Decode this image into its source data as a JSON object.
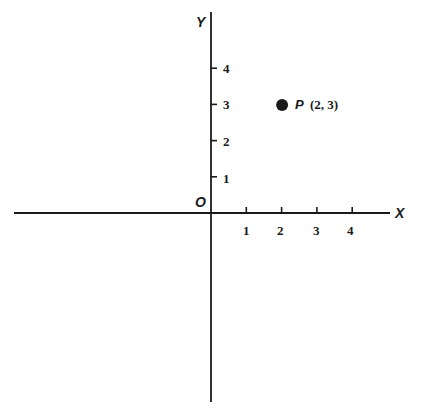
{
  "chart_data": {
    "type": "scatter",
    "title": "",
    "xlabel": "X",
    "ylabel": "Y",
    "origin_label": "O",
    "x_ticks": [
      "1",
      "2",
      "3",
      "4"
    ],
    "y_ticks": [
      "1",
      "2",
      "3",
      "4"
    ],
    "xlim": [
      -5.6,
      5.2
    ],
    "ylim": [
      -5.2,
      5.6
    ],
    "grid": false,
    "legend": "none",
    "series": [
      {
        "name": "P",
        "points": [
          {
            "x": 2,
            "y": 3,
            "label": "P",
            "coord_text": "(2, 3)"
          }
        ]
      }
    ],
    "colors": {
      "ink": "#1a1a1a",
      "background": "#ffffff"
    }
  }
}
